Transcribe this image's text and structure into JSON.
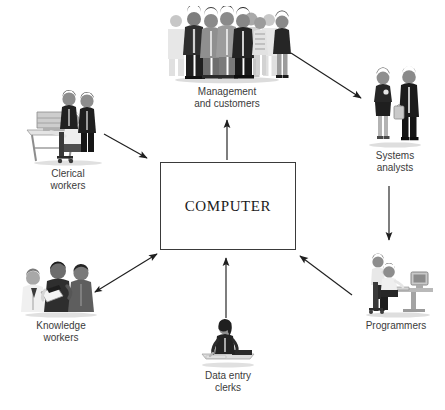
{
  "diagram": {
    "center": {
      "label": "COMPUTER",
      "shape": "rectangle"
    },
    "nodes": [
      {
        "id": "management",
        "label": "Management\nand customers",
        "label_line1": "Management",
        "label_line2": "and customers",
        "art": "group-of-business-people"
      },
      {
        "id": "systems-analysts",
        "label": "Systems\nanalysts",
        "label_line1": "Systems",
        "label_line2": "analysts",
        "art": "businesswoman-and-businessman-with-briefcase"
      },
      {
        "id": "programmers",
        "label": "Programmers",
        "label_line1": "Programmers",
        "label_line2": "",
        "art": "two-people-at-computer-workstation"
      },
      {
        "id": "data-entry-clerks",
        "label": "Data entry\nclerks",
        "label_line1": "Data entry",
        "label_line2": "clerks",
        "art": "woman-writing-at-desk"
      },
      {
        "id": "knowledge-workers",
        "label": "Knowledge\nworkers",
        "label_line1": "Knowledge",
        "label_line2": "workers",
        "art": "three-people-reviewing-documents"
      },
      {
        "id": "clerical-workers",
        "label": "Clerical\nworkers",
        "label_line1": "Clerical",
        "label_line2": "workers",
        "art": "two-people-behind-seated-worker-at-machine"
      }
    ],
    "connections": [
      {
        "id": "clerical-to-computer",
        "from": "clerical-workers",
        "to": "computer",
        "heads": "single"
      },
      {
        "id": "knowledge-to-computer",
        "from": "knowledge-workers",
        "to": "computer",
        "heads": "double"
      },
      {
        "id": "dataentry-to-computer",
        "from": "data-entry-clerks",
        "to": "computer",
        "heads": "single"
      },
      {
        "id": "programmers-to-computer",
        "from": "programmers",
        "to": "computer",
        "heads": "single"
      },
      {
        "id": "computer-to-management",
        "from": "computer",
        "to": "management",
        "heads": "single"
      },
      {
        "id": "management-to-analysts",
        "from": "management",
        "to": "systems-analysts",
        "heads": "single"
      },
      {
        "id": "analysts-to-programmers",
        "from": "systems-analysts",
        "to": "programmers",
        "heads": "single"
      }
    ],
    "colors": {
      "background": "#ffffff",
      "line": "#2b2b2b",
      "box_border": "#3a3a3a",
      "box_text": "#1a1a1a",
      "caption_text": "#3b3b3b"
    }
  }
}
